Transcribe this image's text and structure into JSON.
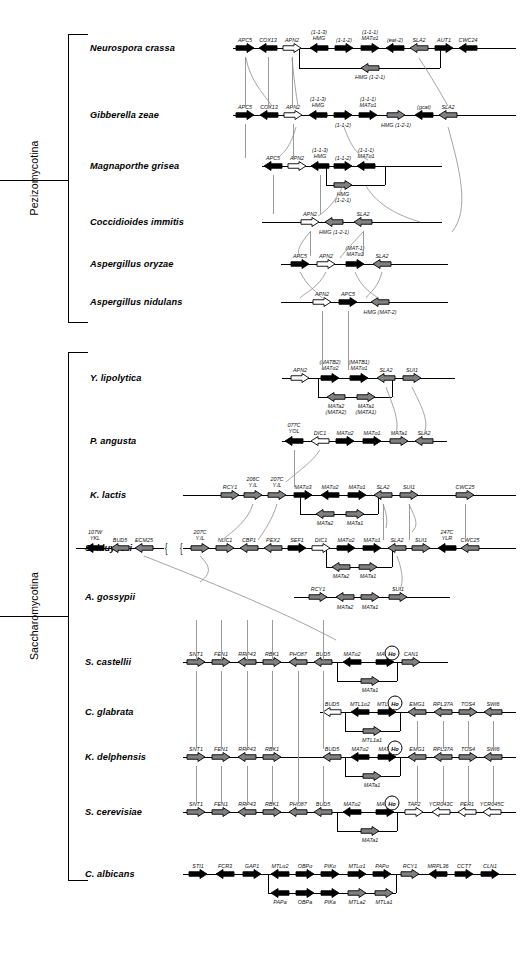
{
  "figure": {
    "clades": [
      {
        "name": "Pezizomycotina",
        "label": "Pezizomycotina"
      },
      {
        "name": "Saccharomycotina",
        "label": "Saccharomycotina"
      }
    ]
  },
  "colors": {
    "black": "#000000",
    "gray": "#808080",
    "white": "#ffffff",
    "line": "#000000",
    "connector": "#8d8d8d"
  },
  "legend_fill_meaning": {
    "black": "MAT / HMG related gene",
    "gray": "flanking conserved gene",
    "white": "other gene"
  },
  "rows": [
    {
      "species": "Neurospora crassa",
      "clade": "Pezizomycotina",
      "genes": [
        {
          "label": "APC5",
          "fill": "black",
          "dir": "right"
        },
        {
          "label": "COX13",
          "fill": "black",
          "dir": "left"
        },
        {
          "label": "APN2",
          "fill": "white",
          "dir": "right"
        },
        {
          "label": "HMG",
          "sublabel": "(1-1-3)",
          "fill": "black",
          "dir": "left"
        },
        {
          "label": "(1-1-2)",
          "fill": "black",
          "dir": "right"
        },
        {
          "label": "MATα1",
          "sublabel": "(1-1-1)",
          "fill": "black",
          "dir": "right"
        },
        {
          "label": "(eat-2)",
          "fill": "black",
          "dir": "left"
        },
        {
          "label": "SLA2",
          "fill": "gray",
          "dir": "left"
        },
        {
          "label": "AUT1",
          "fill": "black",
          "dir": "right"
        },
        {
          "label": "CWC24",
          "fill": "black",
          "dir": "left"
        }
      ],
      "alt_genes": [
        {
          "label": "HMG (1-2-1)",
          "fill": "gray",
          "dir": "left"
        }
      ]
    },
    {
      "species": "Gibberella zeae",
      "clade": "Pezizomycotina",
      "genes": [
        {
          "label": "APC5",
          "fill": "black",
          "dir": "right"
        },
        {
          "label": "COX13",
          "fill": "black",
          "dir": "left"
        },
        {
          "label": "APN2",
          "fill": "white",
          "dir": "right"
        },
        {
          "label": "HMG",
          "sublabel": "(1-1-3)",
          "fill": "black",
          "dir": "left"
        },
        {
          "label": "(1-1-2)",
          "fill": "black",
          "dir": "right",
          "labelbelow": true
        },
        {
          "label": "MATα1",
          "sublabel": "(1-1-1)",
          "fill": "black",
          "dir": "right"
        },
        {
          "label": "HMG (1-2-1)",
          "fill": "gray",
          "dir": "right",
          "labelbelow": true
        },
        {
          "label": "(gcat)",
          "fill": "black",
          "dir": "left"
        },
        {
          "label": "SLA2",
          "fill": "gray",
          "dir": "left"
        }
      ],
      "alt_genes": []
    },
    {
      "species": "Magnaporthe grisea",
      "clade": "Pezizomycotina",
      "genes": [
        {
          "label": "APC5",
          "fill": "black",
          "dir": "left"
        },
        {
          "label": "APN2",
          "fill": "white",
          "dir": "right"
        },
        {
          "label": "HMG",
          "sublabel": "(1-1-3)",
          "fill": "black",
          "dir": "left"
        },
        {
          "label": "(1-1-2)",
          "fill": "black",
          "dir": "right"
        },
        {
          "label": "MATα1",
          "sublabel": "(1-1-1)",
          "fill": "black",
          "dir": "left"
        }
      ],
      "alt_genes": [
        {
          "label": "HMG",
          "sublabel2": "(1-2-1)",
          "fill": "gray",
          "dir": "right"
        }
      ]
    },
    {
      "species": "Coccidioides immitis",
      "clade": "Pezizomycotina",
      "genes": [
        {
          "label": "APN2",
          "fill": "white",
          "dir": "right"
        },
        {
          "label": "HMG (1-2-1)",
          "fill": "gray",
          "dir": "left",
          "labelbelow": true
        },
        {
          "label": "SLA2",
          "fill": "gray",
          "dir": "left"
        }
      ],
      "alt_genes": []
    },
    {
      "species": "Aspergillus oryzae",
      "clade": "Pezizomycotina",
      "genes": [
        {
          "label": "APC5",
          "fill": "black",
          "dir": "right"
        },
        {
          "label": "APN2",
          "fill": "white",
          "dir": "right"
        },
        {
          "label": "MATα1",
          "sublabel": "(MAT-1)",
          "fill": "black",
          "dir": "right"
        },
        {
          "label": "SLA2",
          "fill": "gray",
          "dir": "left"
        }
      ],
      "alt_genes": []
    },
    {
      "species": "Aspergillus nidulans",
      "clade": "Pezizomycotina",
      "genes": [
        {
          "label": "APN2",
          "fill": "white",
          "dir": "right"
        },
        {
          "label": "APC5",
          "fill": "black",
          "dir": "right"
        },
        {
          "label": "HMG (MAT-2)",
          "fill": "gray",
          "dir": "left",
          "labelbelow": true
        }
      ],
      "alt_genes": []
    },
    {
      "species": "Y. lipolytica",
      "clade": "Saccharomycotina",
      "genes": [
        {
          "label": "APN2",
          "fill": "white",
          "dir": "right"
        },
        {
          "label": "MATα2",
          "sublabel": "(MATB2)",
          "fill": "black",
          "dir": "right"
        },
        {
          "label": "MATα1",
          "sublabel": "(MATB1)",
          "fill": "black",
          "dir": "right"
        },
        {
          "label": "SLA2",
          "fill": "gray",
          "dir": "left"
        },
        {
          "label": "SUI1",
          "fill": "gray",
          "dir": "right"
        }
      ],
      "alt_genes": [
        {
          "label": "MATa2",
          "sublabel2": "(MATA2)",
          "fill": "gray",
          "dir": "left"
        },
        {
          "label": "MATa1",
          "sublabel2": "(MATA1)",
          "fill": "gray",
          "dir": "right"
        }
      ]
    },
    {
      "species": "P. angusta",
      "clade": "Saccharomycotina",
      "genes": [
        {
          "label": "YOL",
          "sublabel": "077C",
          "fill": "black",
          "dir": "left"
        },
        {
          "label": "DIC1",
          "fill": "white",
          "dir": "left"
        },
        {
          "label": "MATα2",
          "fill": "black",
          "dir": "right"
        },
        {
          "label": "MATα1",
          "fill": "black",
          "dir": "right"
        },
        {
          "label": "MATa1",
          "fill": "gray",
          "dir": "right"
        },
        {
          "label": "SLA2",
          "fill": "gray",
          "dir": "left"
        }
      ],
      "alt_genes": []
    },
    {
      "species": "K. lactis",
      "clade": "Saccharomycotina",
      "genes": [
        {
          "label": "RCY1",
          "fill": "gray",
          "dir": "right"
        },
        {
          "label": "Y.lL",
          "sublabel": "206C",
          "fill": "gray",
          "dir": "right"
        },
        {
          "label": "Y.lL",
          "sublabel": "207C",
          "fill": "gray",
          "dir": "right"
        },
        {
          "label": "MATα3",
          "fill": "black",
          "dir": "right"
        },
        {
          "label": "MATα2",
          "fill": "black",
          "dir": "left"
        },
        {
          "label": "MATα1",
          "fill": "black",
          "dir": "right"
        },
        {
          "label": "SLA2",
          "fill": "gray",
          "dir": "left"
        },
        {
          "label": "SUI1",
          "fill": "gray",
          "dir": "right"
        },
        {
          "label": "CWC25",
          "fill": "gray",
          "dir": "right"
        }
      ],
      "alt_genes": [
        {
          "label": "MATa2",
          "fill": "gray",
          "dir": "left"
        },
        {
          "label": "MATa1",
          "fill": "gray",
          "dir": "right"
        }
      ]
    },
    {
      "species": "S. kluyveri",
      "clade": "Saccharomycotina",
      "genes": [
        {
          "label": "YKL",
          "sublabel": "107W",
          "fill": "black",
          "dir": "left"
        },
        {
          "label": "BUD5",
          "fill": "gray",
          "dir": "left"
        },
        {
          "label": "ECM25",
          "fill": "gray",
          "dir": "left"
        },
        {
          "label": "Y.lL",
          "sublabel": "207C",
          "fill": "gray",
          "dir": "right"
        },
        {
          "label": "NUC1",
          "fill": "gray",
          "dir": "right"
        },
        {
          "label": "CBP1",
          "fill": "gray",
          "dir": "left"
        },
        {
          "label": "PEX2",
          "fill": "gray",
          "dir": "left"
        },
        {
          "label": "SEF1",
          "fill": "black",
          "dir": "right"
        },
        {
          "label": "DIC1",
          "fill": "white",
          "dir": "right"
        },
        {
          "label": "MATα2",
          "fill": "black",
          "dir": "right"
        },
        {
          "label": "MATα1",
          "fill": "black",
          "dir": "right"
        },
        {
          "label": "SLA2",
          "fill": "gray",
          "dir": "left"
        },
        {
          "label": "SUI1",
          "fill": "gray",
          "dir": "right"
        },
        {
          "label": "YLR",
          "sublabel": "247C",
          "fill": "black",
          "dir": "left"
        },
        {
          "label": "CWC25",
          "fill": "gray",
          "dir": "left"
        }
      ],
      "alt_genes": [
        {
          "label": "MATa2",
          "fill": "gray",
          "dir": "left"
        },
        {
          "label": "MATa1",
          "fill": "gray",
          "dir": "right"
        }
      ]
    },
    {
      "species": "A. gossypii",
      "clade": "Saccharomycotina",
      "genes": [
        {
          "label": "RCY1",
          "fill": "gray",
          "dir": "right"
        },
        {
          "label": "MATa2",
          "fill": "gray",
          "dir": "left",
          "labelbelow": true
        },
        {
          "label": "MATa1",
          "fill": "gray",
          "dir": "right",
          "labelbelow": true
        },
        {
          "label": "SUI1",
          "fill": "gray",
          "dir": "right"
        }
      ],
      "alt_genes": []
    },
    {
      "species": "S. castellii",
      "clade": "Saccharomycotina",
      "genes": [
        {
          "label": "SNT1",
          "fill": "gray",
          "dir": "right"
        },
        {
          "label": "FEN1",
          "fill": "gray",
          "dir": "right"
        },
        {
          "label": "RRP43",
          "fill": "gray",
          "dir": "left"
        },
        {
          "label": "RBK1",
          "fill": "gray",
          "dir": "right"
        },
        {
          "label": "PHO87",
          "fill": "gray",
          "dir": "left"
        },
        {
          "label": "BUD5",
          "fill": "gray",
          "dir": "left"
        },
        {
          "label": "MATα2",
          "fill": "black",
          "dir": "left"
        },
        {
          "label": "MATα1",
          "fill": "black",
          "dir": "right"
        },
        {
          "label": "CAN1",
          "fill": "gray",
          "dir": "right"
        }
      ],
      "alt_genes": [
        {
          "label": "MATa1",
          "fill": "gray",
          "dir": "right"
        }
      ],
      "ho": true
    },
    {
      "species": "C. glabrata",
      "clade": "Saccharomycotina",
      "genes": [
        {
          "label": "BUD5",
          "fill": "white",
          "dir": "left"
        },
        {
          "label": "MTL1α2",
          "fill": "black",
          "dir": "left"
        },
        {
          "label": "MTL1α1",
          "fill": "black",
          "dir": "right"
        },
        {
          "label": "EMG1",
          "fill": "gray",
          "dir": "left"
        },
        {
          "label": "RPL37A",
          "fill": "gray",
          "dir": "left"
        },
        {
          "label": "TOS4",
          "fill": "gray",
          "dir": "right"
        },
        {
          "label": "SWI6",
          "fill": "gray",
          "dir": "left"
        }
      ],
      "alt_genes": [
        {
          "label": "MTL1a1",
          "fill": "gray",
          "dir": "right"
        }
      ],
      "ho": true
    },
    {
      "species": "K. delphensis",
      "clade": "Saccharomycotina",
      "genes": [
        {
          "label": "SNT1",
          "fill": "gray",
          "dir": "right"
        },
        {
          "label": "FEN1",
          "fill": "gray",
          "dir": "right"
        },
        {
          "label": "RRP43",
          "fill": "gray",
          "dir": "left"
        },
        {
          "label": "RBK1",
          "fill": "gray",
          "dir": "right"
        },
        {
          "label": "BUD5",
          "fill": "gray",
          "dir": "left"
        },
        {
          "label": "MATα2",
          "fill": "black",
          "dir": "left"
        },
        {
          "label": "MATα1",
          "fill": "black",
          "dir": "right"
        },
        {
          "label": "EMG1",
          "fill": "gray",
          "dir": "left"
        },
        {
          "label": "RPL37A",
          "fill": "gray",
          "dir": "left"
        },
        {
          "label": "TOS4",
          "fill": "gray",
          "dir": "right"
        },
        {
          "label": "SWI6",
          "fill": "gray",
          "dir": "left"
        }
      ],
      "alt_genes": [
        {
          "label": "MATa1",
          "fill": "gray",
          "dir": "right"
        }
      ],
      "ho": true
    },
    {
      "species": "S. cerevisiae",
      "clade": "Saccharomycotina",
      "genes": [
        {
          "label": "SNT1",
          "fill": "gray",
          "dir": "right"
        },
        {
          "label": "FEN1",
          "fill": "gray",
          "dir": "right"
        },
        {
          "label": "RRP43",
          "fill": "gray",
          "dir": "left"
        },
        {
          "label": "RBK1",
          "fill": "gray",
          "dir": "right"
        },
        {
          "label": "PHO87",
          "fill": "gray",
          "dir": "left"
        },
        {
          "label": "BUD5",
          "fill": "gray",
          "dir": "left"
        },
        {
          "label": "MATα2",
          "fill": "black",
          "dir": "left"
        },
        {
          "label": "MATα1",
          "fill": "black",
          "dir": "right"
        },
        {
          "label": "TAF2",
          "fill": "white",
          "dir": "right"
        },
        {
          "label": "YCR043C",
          "fill": "white",
          "dir": "left"
        },
        {
          "label": "PER1",
          "fill": "white",
          "dir": "left"
        },
        {
          "label": "YCR045C",
          "fill": "white",
          "dir": "left"
        }
      ],
      "alt_genes": [
        {
          "label": "MATa1",
          "fill": "gray",
          "dir": "right"
        }
      ],
      "ho": true
    },
    {
      "species": "C. albicans",
      "clade": "Saccharomycotina",
      "genes": [
        {
          "label": "STI1",
          "fill": "black",
          "dir": "right"
        },
        {
          "label": "FCR3",
          "fill": "black",
          "dir": "left"
        },
        {
          "label": "GAP1",
          "fill": "black",
          "dir": "right"
        },
        {
          "label": "MTLα2",
          "fill": "black",
          "dir": "left"
        },
        {
          "label": "OBPα",
          "fill": "black",
          "dir": "right"
        },
        {
          "label": "PIKα",
          "fill": "black",
          "dir": "right"
        },
        {
          "label": "MTLα1",
          "fill": "black",
          "dir": "right"
        },
        {
          "label": "PAPα",
          "fill": "black",
          "dir": "right"
        },
        {
          "label": "RCY1",
          "fill": "gray",
          "dir": "right"
        },
        {
          "label": "MRPL36",
          "fill": "black",
          "dir": "left"
        },
        {
          "label": "CCT7",
          "fill": "black",
          "dir": "right"
        },
        {
          "label": "CLN1",
          "fill": "black",
          "dir": "right"
        }
      ],
      "alt_genes": [
        {
          "label": "PAPa",
          "fill": "black",
          "dir": "left"
        },
        {
          "label": "OBPa",
          "fill": "black",
          "dir": "right"
        },
        {
          "label": "PIKa",
          "fill": "black",
          "dir": "right"
        },
        {
          "label": "MTLa2",
          "fill": "gray",
          "dir": "right"
        },
        {
          "label": "MTLa1",
          "fill": "gray",
          "dir": "right"
        }
      ]
    }
  ]
}
